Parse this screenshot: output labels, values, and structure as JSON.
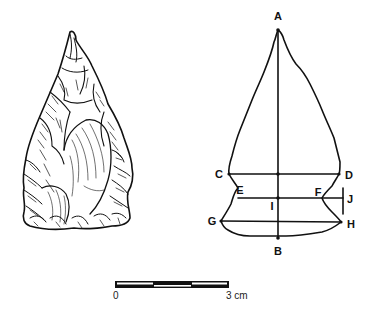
{
  "figure": {
    "drawing": {
      "description": "Illustration of a flaked stone projectile point"
    },
    "outline": {
      "labels": {
        "A": "A",
        "B": "B",
        "C": "C",
        "D": "D",
        "E": "E",
        "F": "F",
        "G": "G",
        "H": "H",
        "I": "I",
        "J": "J"
      }
    },
    "scale_bar": {
      "start_label": "0",
      "end_label": "3 cm",
      "segments": 3,
      "units": "cm"
    }
  }
}
